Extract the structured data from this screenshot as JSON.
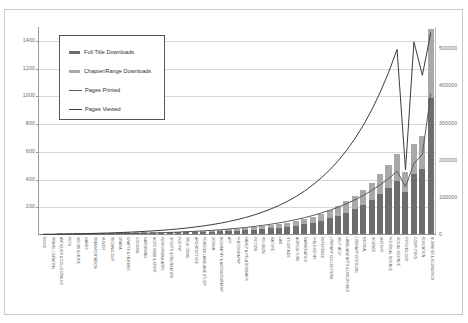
{
  "chart_data": {
    "type": "bar",
    "title": "",
    "subtitle": "",
    "xlabel": "",
    "ylabel": "",
    "grid": true,
    "legend_position": "top-left-inside",
    "stacked": true,
    "axes": {
      "left": {
        "label": "",
        "ticks": [
          0,
          200,
          400,
          600,
          800,
          1000,
          1200,
          1400
        ],
        "tick_labels": [
          "0",
          "200",
          "400",
          "600",
          "800",
          "1000",
          "1200",
          "1400"
        ],
        "ylim": [
          0,
          1500
        ],
        "applies_to": [
          "Full Title Downloads",
          "Chapter/Range Downloads"
        ]
      },
      "right": {
        "label": "",
        "ticks": [
          0,
          100000,
          200000,
          300000,
          400000,
          500000
        ],
        "tick_labels": [
          "0",
          "100000",
          "200000",
          "300000",
          "400000",
          "500000"
        ],
        "ylim": [
          0,
          560000
        ],
        "applies_to": [
          "Pages Printed",
          "Pages Viewed"
        ]
      }
    },
    "legend": [
      {
        "label": "Full Title Downloads",
        "marker": "bar",
        "color": "#6d6d6d"
      },
      {
        "label": "Chapter/Range Downloads",
        "marker": "bar",
        "color": "#a9a9a9"
      },
      {
        "label": "Pages Printed",
        "marker": "line",
        "color": "#5a5a5a"
      },
      {
        "label": "Pages Viewed",
        "marker": "line",
        "color": "#3c3c3c"
      }
    ],
    "categories": [
      "MUSIC",
      "TRAVEL / GENERAL",
      "ANTIQUES & COLLECTIBLES",
      "PETS",
      "HOUSE & HOME",
      "GAMES",
      "TRANSPORTATION",
      "HUMOR",
      "TECHNOLOGY",
      "DRAMA",
      "CRAFTS & HOBBIES",
      "COOKING",
      "GARDENING",
      "BODY, MIND & SPIRIT",
      "PERFORMING ARTS",
      "SPORTS & RECREATION",
      "POETRY",
      "TRUE CRIME",
      "ARCHITECTURE",
      "FOREIGN LANGUAGE STUDY",
      "DESIGN",
      "BIOGRAPHY & AUTOBIOGRAPHY",
      "ART",
      "PHOTOGRAPHY",
      "FAMILY & RELATIONSHIPS",
      "FICTION",
      "RELIGION",
      "NATURE",
      "LAW",
      "STUDY AIDS",
      "AGRICULTURE",
      "MATHEMATICS",
      "PHILOSOPHY",
      "REFERENCE",
      "LITERARY COLLECTIONS",
      "SELF-HELP",
      "LANGUAGE ARTS & DISCIPLINES",
      "LITERARY CRITICISM",
      "MEDICAL",
      "SCIENCE",
      "HISTORY",
      "POLITICAL SCIENCE",
      "SOCIAL SCIENCE",
      "PSYCHOLOGY",
      "COMPUTERS",
      "EDUCATION",
      "BUSINESS & ECONOMICS"
    ],
    "series": [
      {
        "name": "Full Title Downloads",
        "axis": "left",
        "type": "bar-stack-bottom",
        "color": "#6d6d6d",
        "values": [
          2,
          2,
          3,
          3,
          4,
          4,
          5,
          5,
          6,
          6,
          7,
          8,
          8,
          9,
          10,
          11,
          12,
          13,
          14,
          16,
          18,
          20,
          22,
          25,
          28,
          32,
          36,
          40,
          46,
          52,
          60,
          70,
          82,
          96,
          112,
          132,
          155,
          180,
          210,
          245,
          285,
          330,
          380,
          300,
          430,
          470,
          980
        ]
      },
      {
        "name": "Chapter/Range Downloads",
        "axis": "left",
        "type": "bar-stack-top",
        "color": "#a9a9a9",
        "values": [
          1,
          1,
          1,
          2,
          2,
          2,
          2,
          3,
          3,
          3,
          4,
          4,
          4,
          5,
          5,
          6,
          6,
          7,
          8,
          9,
          10,
          11,
          12,
          14,
          15,
          17,
          19,
          22,
          25,
          28,
          32,
          37,
          43,
          50,
          58,
          68,
          80,
          93,
          108,
          126,
          146,
          170,
          196,
          150,
          220,
          240,
          500
        ]
      },
      {
        "name": "Pages Printed",
        "axis": "right",
        "type": "line",
        "color": "#5a5a5a",
        "values": [
          1200,
          1300,
          1500,
          1700,
          1900,
          2100,
          2400,
          2700,
          3000,
          3400,
          3800,
          4300,
          4800,
          5400,
          6100,
          6900,
          7800,
          8800,
          9900,
          11200,
          12600,
          14200,
          16000,
          18000,
          20300,
          22900,
          25800,
          29000,
          32700,
          36800,
          41400,
          46600,
          52500,
          59100,
          66500,
          74800,
          84200,
          94800,
          106700,
          120100,
          135200,
          152200,
          171300,
          130000,
          192800,
          217000,
          380000
        ]
      },
      {
        "name": "Pages Viewed",
        "axis": "right",
        "type": "line",
        "color": "#3c3c3c",
        "values": [
          2000,
          2200,
          2500,
          2900,
          3300,
          3800,
          4300,
          5000,
          5700,
          6500,
          7400,
          8500,
          9700,
          11000,
          12600,
          14400,
          16400,
          18700,
          21400,
          24400,
          27800,
          31700,
          36200,
          41300,
          47100,
          53700,
          61300,
          69900,
          79700,
          90900,
          103600,
          118100,
          134700,
          153600,
          175100,
          199600,
          227600,
          259500,
          295800,
          337200,
          384400,
          438200,
          499500,
          175000,
          520000,
          430000,
          545000
        ]
      }
    ]
  }
}
